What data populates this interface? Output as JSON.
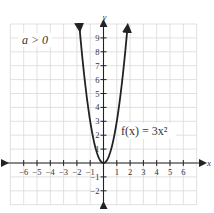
{
  "chart_data": {
    "type": "line",
    "title": "",
    "function_label": "f(x) = 3x²",
    "condition_label": "a > 0",
    "xlabel": "x",
    "ylabel": "y",
    "xlim": [
      -7,
      7
    ],
    "ylim": [
      -3,
      10
    ],
    "grid": true,
    "x_ticks": [
      -6,
      -5,
      -4,
      -3,
      -2,
      -1,
      1,
      2,
      3,
      4,
      5,
      6
    ],
    "y_ticks": [
      -2,
      -1,
      1,
      2,
      3,
      4,
      5,
      6,
      7,
      8,
      9
    ],
    "series": [
      {
        "name": "f(x) = 3x^2",
        "function": "3*x^2",
        "x": [
          -1.8,
          -1.5,
          -1,
          -0.5,
          0,
          0.5,
          1,
          1.5,
          1.8
        ],
        "y": [
          9.72,
          6.75,
          3,
          0.75,
          0,
          0.75,
          3,
          6.75,
          9.72
        ],
        "arrows_at_ends": true
      }
    ],
    "colors": {
      "curve": "#222222",
      "grid": "#d9d9d9",
      "axis": "#222222"
    }
  }
}
